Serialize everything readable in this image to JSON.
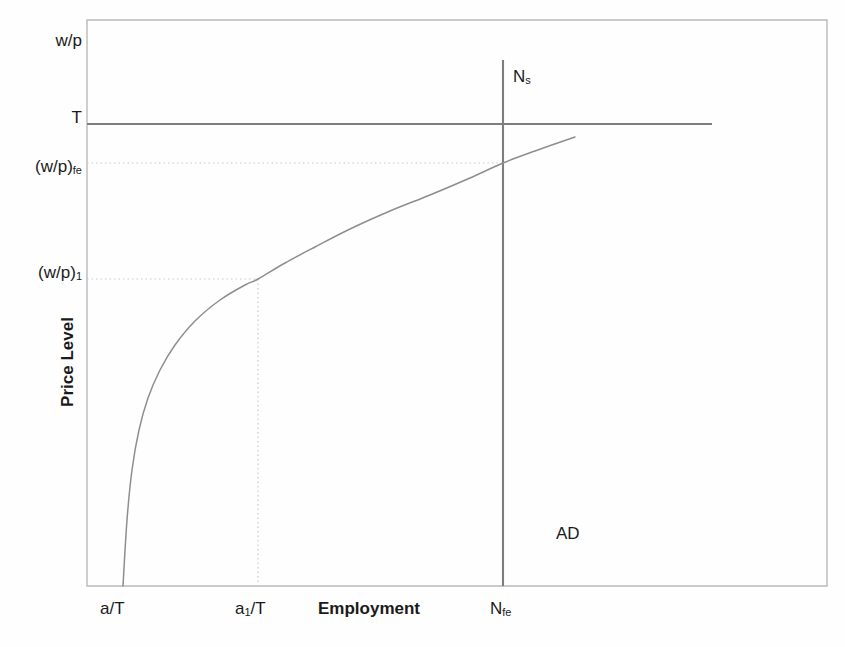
{
  "figure": {
    "background_color": "#fefefe",
    "frame_color": "#b9b9b9",
    "curve_color": "#8e8e8e",
    "guide_color": "#c9c9c9",
    "line_color": "#7d7d7d",
    "text_color": "#1a1a1a"
  },
  "axes": {
    "y_title": "Price Level",
    "x_title": "Employment",
    "y_tick_labels": [
      {
        "id": "wp-max",
        "text": "w/p",
        "sub": ""
      },
      {
        "id": "T",
        "text": "T",
        "sub": ""
      },
      {
        "id": "wp-fe",
        "text": "(w/p)",
        "sub": "fe"
      },
      {
        "id": "wp-1",
        "text": "(w/p)",
        "sub": "1"
      }
    ],
    "x_tick_labels": [
      {
        "id": "a-over-T",
        "text": "a/T",
        "sub": ""
      },
      {
        "id": "a1-over-T",
        "text": "a",
        "sub": "1",
        "suffix": "/T"
      },
      {
        "id": "N-fe",
        "text": "N",
        "sub": "fe"
      }
    ]
  },
  "curves": {
    "labour_supply": "N",
    "labour_supply_sub": "s",
    "aggregate_demand": "AD",
    "real_wage_ceiling": "T"
  },
  "chart_data": {
    "type": "line",
    "xlabel": "Employment",
    "ylabel": "Price Level",
    "xlim": [
      87,
      827
    ],
    "ylim": [
      586,
      20
    ],
    "grid": false,
    "legend": "none",
    "annotations": [
      {
        "label": "N",
        "sub": "s",
        "x": 516,
        "y": 80,
        "desc": "labour supply curve label"
      },
      {
        "label": "AD",
        "sub": "",
        "x": 565,
        "y": 535,
        "desc": "aggregate demand label"
      },
      {
        "label": "T",
        "sub": "",
        "x": 60,
        "y": 118,
        "desc": "real wage ceiling level"
      }
    ],
    "series": [
      {
        "name": "AD (aggregate demand, concave increasing)",
        "type": "curve",
        "points": [
          [
            123,
            586
          ],
          [
            127,
            520
          ],
          [
            132,
            470
          ],
          [
            139,
            430
          ],
          [
            148,
            398
          ],
          [
            160,
            370
          ],
          [
            175,
            345
          ],
          [
            195,
            321
          ],
          [
            220,
            300
          ],
          [
            245,
            285
          ],
          [
            258,
            279
          ],
          [
            285,
            263
          ],
          [
            315,
            247
          ],
          [
            350,
            229
          ],
          [
            390,
            211
          ],
          [
            430,
            195
          ],
          [
            470,
            178
          ],
          [
            503,
            163
          ],
          [
            535,
            151
          ],
          [
            575,
            137
          ]
        ]
      },
      {
        "name": "Ns (labour supply, vertical at full employment)",
        "type": "vline",
        "x": 503,
        "y_from": 60,
        "y_to": 586
      },
      {
        "name": "T (real wage ceiling, horizontal)",
        "type": "hline",
        "y": 124,
        "x_from": 87,
        "x_to": 712
      }
    ],
    "guides": [
      {
        "name": "(w/p)fe guide",
        "type": "hline-dotted",
        "y": 163,
        "x_from": 87,
        "x_to": 503
      },
      {
        "name": "(w/p)1 guide",
        "type": "hline-dotted",
        "y": 279,
        "x_from": 87,
        "x_to": 258
      },
      {
        "name": "a1/T guide",
        "type": "vline-dotted",
        "x": 258,
        "y_from": 279,
        "y_to": 586
      }
    ],
    "tick_positions": {
      "y": {
        "wp-max": 41,
        "T": 124,
        "wp-fe": 163,
        "wp-1": 279
      },
      "x": {
        "a-over-T": 123,
        "a1-over-T": 258,
        "N-fe": 503
      }
    }
  }
}
